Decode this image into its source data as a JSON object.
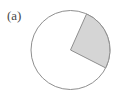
{
  "figure": {
    "label": "(a)",
    "caption_text": "(a)",
    "background_color": "#ffffff"
  },
  "geometry": {
    "canvas": {
      "width": 125,
      "height": 91
    },
    "circle": {
      "center_x": 70.5,
      "center_y": 50,
      "radius": 39.5,
      "stroke_color": "#8f8f8f",
      "stroke_width": 1,
      "fill_color": "#ffffff"
    },
    "sector": {
      "center_x": 70.5,
      "center_y": 50,
      "radius": 39.5,
      "start_angle_deg": -66,
      "end_angle_deg": 27,
      "sweep_deg": 93,
      "fill_color": "#d5d5d5",
      "stroke_color": "#8f8f8f",
      "stroke_width": 1,
      "start_point_x": 86.5,
      "start_point_y": 13.9,
      "end_point_x": 105.7,
      "end_point_y": 67.9
    }
  },
  "chart_data": {
    "type": "pie",
    "title": "(a)",
    "categories": [
      "shaded sector",
      "unshaded remainder"
    ],
    "values": [
      93,
      267
    ],
    "value_unit": "degrees",
    "fractions": [
      0.2583,
      0.7417
    ],
    "colors": [
      "#d5d5d5",
      "#ffffff"
    ],
    "legend": "none",
    "grid": false,
    "xlabel": "",
    "ylabel": ""
  }
}
